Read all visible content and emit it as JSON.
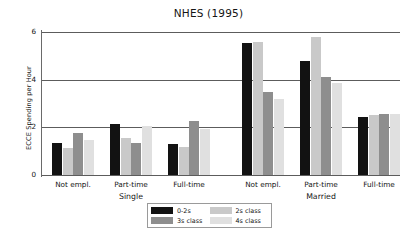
{
  "chart_data": {
    "type": "bar",
    "title": "NHES (1995)",
    "xlabel": "",
    "ylabel": "ECCE Spending per Hour",
    "ylim": [
      0,
      6
    ],
    "yticks": [
      0,
      2,
      4,
      6
    ],
    "ytick_labels": [
      "0",
      "2",
      "4",
      "6"
    ],
    "grid": true,
    "legend_position": "bottom-center",
    "group_labels": [
      "Single",
      "Married"
    ],
    "categories": [
      "Not empl.",
      "Part-time",
      "Full-time",
      "Not empl.",
      "Part-time",
      "Full-time"
    ],
    "category_groups": [
      "Single",
      "Single",
      "Single",
      "Married",
      "Married",
      "Married"
    ],
    "series": [
      {
        "name": "0-2s",
        "color": "#121212",
        "values": [
          1.35,
          2.15,
          1.32,
          5.55,
          4.8,
          2.45
        ]
      },
      {
        "name": "2s class",
        "color": "#c9c9c9",
        "values": [
          1.15,
          1.55,
          1.18,
          5.6,
          5.8,
          2.5
        ]
      },
      {
        "name": "3s class",
        "color": "#8e8e8e",
        "values": [
          1.75,
          1.35,
          2.25,
          3.5,
          4.1,
          2.58
        ]
      },
      {
        "name": "4s class",
        "color": "#e0e0e0",
        "values": [
          1.48,
          2.05,
          1.95,
          3.18,
          3.85,
          2.55
        ]
      }
    ]
  },
  "legend": {
    "entries": [
      {
        "label": "0-2s",
        "color": "#121212"
      },
      {
        "label": "2s class",
        "color": "#c9c9c9"
      },
      {
        "label": "3s class",
        "color": "#8e8e8e"
      },
      {
        "label": "4s class",
        "color": "#e0e0e0"
      }
    ]
  },
  "colors": {
    "axis": "#5c5c5c",
    "text": "#151515",
    "background": "#ffffff",
    "legend_border": "#9a9a9a"
  }
}
